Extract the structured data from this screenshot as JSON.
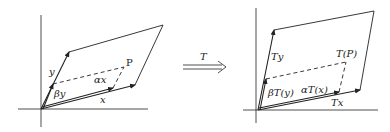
{
  "diagram": {
    "left": {
      "labels": {
        "y": "y",
        "beta_y": "βy",
        "alpha_x": "αx",
        "x": "x",
        "P": "P"
      }
    },
    "map_arrow": {
      "label": "T"
    },
    "right": {
      "labels": {
        "Ty": "Ty",
        "TP": "T(P)",
        "beta_Ty": "βT(y)",
        "alpha_Tx": "αT(x)",
        "Tx": "Tx"
      }
    },
    "colors": {
      "stroke": "#222222",
      "background": "#ffffff"
    }
  }
}
